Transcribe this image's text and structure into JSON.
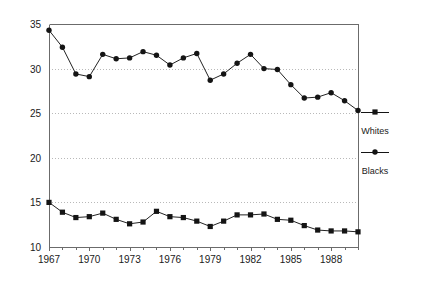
{
  "chart_data": {
    "type": "line",
    "title": "",
    "subtitle": "",
    "xlabel": "",
    "ylabel": "",
    "xlim": [
      1967,
      1990
    ],
    "ylim": [
      10,
      35
    ],
    "yticks": [
      10,
      15,
      20,
      25,
      30,
      35
    ],
    "ytick_labels": [
      "10",
      "15",
      "20",
      "25",
      "30",
      "35"
    ],
    "xticks": [
      1967,
      1968,
      1969,
      1970,
      1971,
      1972,
      1973,
      1974,
      1975,
      1976,
      1977,
      1978,
      1979,
      1980,
      1981,
      1982,
      1983,
      1984,
      1985,
      1986,
      1987,
      1988,
      1989,
      1990
    ],
    "xtick_labels_shown": [
      "1967",
      "1970",
      "1973",
      "1976",
      "1979",
      "1982",
      "1985",
      "1988"
    ],
    "xtick_labeled_values": [
      1967,
      1970,
      1973,
      1976,
      1979,
      1982,
      1985,
      1988
    ],
    "x": [
      1967,
      1968,
      1969,
      1970,
      1971,
      1972,
      1973,
      1974,
      1975,
      1976,
      1977,
      1978,
      1979,
      1980,
      1981,
      1982,
      1983,
      1984,
      1985,
      1986,
      1987,
      1988,
      1989,
      1990
    ],
    "grid": {
      "horizontal": true,
      "vertical": false,
      "style": "dotted"
    },
    "legend": {
      "position": "right",
      "entries": [
        {
          "name": "Whites",
          "marker": "square"
        },
        {
          "name": "Blacks",
          "marker": "circle"
        }
      ]
    },
    "series": [
      {
        "name": "Whites",
        "marker": "square",
        "color": "#141414",
        "values": [
          15.0,
          13.9,
          13.3,
          13.4,
          13.8,
          13.1,
          12.6,
          12.8,
          14.0,
          13.4,
          13.3,
          12.9,
          12.3,
          12.9,
          13.6,
          13.6,
          13.7,
          13.1,
          13.0,
          12.4,
          11.9,
          11.8,
          11.8,
          11.7
        ]
      },
      {
        "name": "Blacks",
        "marker": "circle",
        "color": "#141414",
        "values": [
          34.3,
          32.4,
          29.4,
          29.1,
          31.6,
          31.1,
          31.2,
          31.9,
          31.5,
          30.4,
          31.2,
          31.7,
          28.7,
          29.4,
          30.6,
          31.6,
          30.0,
          29.9,
          28.2,
          26.7,
          26.8,
          27.3,
          26.4,
          25.3
        ]
      }
    ]
  },
  "plot": {
    "left": 49,
    "right": 358,
    "top": 24,
    "bottom": 247
  },
  "legend_box": {
    "x": 375,
    "whites_marker_y": 112,
    "whites_label_y": 134,
    "blacks_marker_y": 152,
    "blacks_label_y": 174
  }
}
